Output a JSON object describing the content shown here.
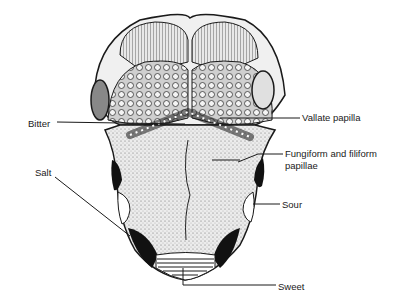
{
  "figure": {
    "labels": {
      "bitter": "Bitter",
      "salt": "Salt",
      "vallate": "Vallate papilla",
      "fungiform_line1": "Fungiform and filiform",
      "fungiform_line2": "papillae",
      "sour": "Sour",
      "sweet": "Sweet"
    },
    "colors": {
      "ink": "#1a1a1a",
      "background": "#ffffff",
      "stipple": "#d8d8d8"
    }
  }
}
